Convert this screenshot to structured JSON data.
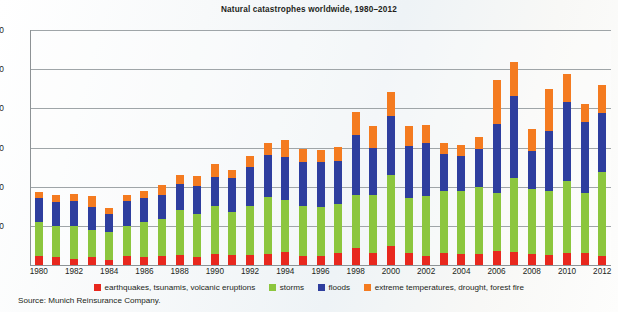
{
  "chart_data": {
    "type": "bar",
    "stacked": true,
    "title": "Natural catastrophes worldwide, 1980–2012",
    "xlabel": "",
    "ylabel": "",
    "ylim": [
      0,
      1200
    ],
    "yticks": [
      200,
      400,
      600,
      800,
      1000,
      1200
    ],
    "grid": true,
    "legend_position": "bottom",
    "source": "Source: Munich Reinsurance Company.",
    "categories": [
      1980,
      1981,
      1982,
      1983,
      1984,
      1985,
      1986,
      1987,
      1988,
      1989,
      1990,
      1991,
      1992,
      1993,
      1994,
      1995,
      1996,
      1997,
      1998,
      1999,
      2000,
      2001,
      2002,
      2003,
      2004,
      2005,
      2006,
      2007,
      2008,
      2009,
      2010,
      2011,
      2012
    ],
    "xtick_labels": [
      "1980",
      "1982",
      "1984",
      "1986",
      "1988",
      "1990",
      "1992",
      "1994",
      "1996",
      "1998",
      "2000",
      "2002",
      "2004",
      "2006",
      "2008",
      "2010",
      "2012"
    ],
    "series": [
      {
        "name": "earthquakes, tsunamis, volcanic eruptions",
        "color": "#e8281e",
        "values": [
          45,
          40,
          30,
          40,
          25,
          45,
          40,
          45,
          50,
          40,
          55,
          50,
          50,
          55,
          65,
          45,
          45,
          60,
          85,
          60,
          95,
          60,
          45,
          60,
          55,
          55,
          70,
          65,
          55,
          50,
          60,
          60,
          45
        ]
      },
      {
        "name": "storms",
        "color": "#8cc63e",
        "values": [
          175,
          160,
          170,
          140,
          145,
          155,
          180,
          190,
          230,
          220,
          245,
          220,
          250,
          290,
          265,
          255,
          250,
          250,
          270,
          295,
          365,
          280,
          305,
          320,
          325,
          345,
          300,
          380,
          335,
          330,
          370,
          310,
          430
        ]
      },
      {
        "name": "floods",
        "color": "#2e3e9e",
        "values": [
          120,
          120,
          125,
          115,
          90,
          125,
          120,
          125,
          135,
          145,
          150,
          175,
          200,
          215,
          220,
          225,
          230,
          220,
          310,
          245,
          300,
          270,
          275,
          185,
          175,
          190,
          350,
          420,
          190,
          305,
          400,
          360,
          300
        ]
      },
      {
        "name": "extreme temperatures, drought, forest fire",
        "color": "#f47b20",
        "values": [
          35,
          40,
          40,
          55,
          30,
          35,
          40,
          50,
          45,
          50,
          65,
          40,
          55,
          65,
          90,
          65,
          60,
          75,
          115,
          110,
          125,
          100,
          90,
          60,
          60,
          65,
          225,
          170,
          115,
          215,
          145,
          90,
          145
        ]
      }
    ]
  },
  "legend": [
    {
      "label": "earthquakes, tsunamis, volcanic eruptions",
      "color": "#e8281e"
    },
    {
      "label": "storms",
      "color": "#8cc63e"
    },
    {
      "label": "floods",
      "color": "#2e3e9e"
    },
    {
      "label": "extreme temperatures, drought, forest fire",
      "color": "#f47b20"
    }
  ]
}
